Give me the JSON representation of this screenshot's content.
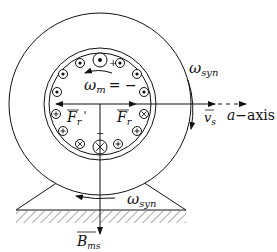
{
  "diagram": {
    "type": "machine-cross-section",
    "labels": {
      "omega_m": "ω",
      "omega_m_sub": "m",
      "omega_m_eq": "= −",
      "omega_syn_right": "ω",
      "omega_syn_right_sub": "syn",
      "omega_syn_bottom": "ω",
      "omega_syn_bottom_sub": "syn",
      "f_r_prime": "F",
      "f_r_prime_sub": "r",
      "f_r_prime_mark": "'",
      "f_r": "F",
      "f_r_sub": "r",
      "v_s": "v",
      "v_s_sub": "s",
      "a_axis": "a",
      "a_axis_rest": "−axis",
      "b_ms": "B",
      "b_ms_sub": "ms",
      "plus_top": "+",
      "minus_bottom": "−"
    },
    "conductors": [
      {
        "pos": "top",
        "symbol": "dot"
      },
      {
        "pos": "top-left",
        "symbol": "dot"
      },
      {
        "pos": "top-right",
        "symbol": "dot"
      },
      {
        "pos": "upper-left",
        "symbol": "dot"
      },
      {
        "pos": "upper-right",
        "symbol": "dot"
      },
      {
        "pos": "left",
        "symbol": "dot"
      },
      {
        "pos": "right",
        "symbol": "dot"
      },
      {
        "pos": "lower-left",
        "symbol": "plus"
      },
      {
        "pos": "lower-right",
        "symbol": "cross"
      },
      {
        "pos": "bottom-left-2",
        "symbol": "plus"
      },
      {
        "pos": "bottom-right-2",
        "symbol": "plus"
      },
      {
        "pos": "bottom-left-1",
        "symbol": "cross"
      },
      {
        "pos": "bottom-right-1",
        "symbol": "plus"
      },
      {
        "pos": "bottom",
        "symbol": "cross"
      }
    ],
    "colors": {
      "stroke": "#111111",
      "background": "#ffffff"
    }
  }
}
